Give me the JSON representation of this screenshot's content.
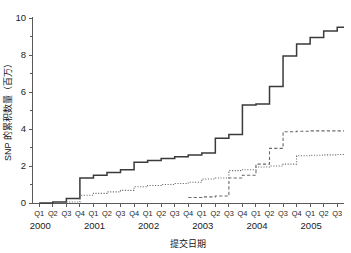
{
  "chart_data": {
    "type": "line",
    "title": "",
    "xlabel": "提交日期",
    "ylabel": "SNP 的累积数量（百万）",
    "ylim": [
      0,
      10
    ],
    "yticks": [
      0,
      2,
      4,
      6,
      8,
      10
    ],
    "ytick_labels": [
      "0",
      "2",
      "4",
      "6",
      "8",
      "10"
    ],
    "y_minor_ticks": [
      1,
      3,
      5,
      7,
      9
    ],
    "grid": false,
    "legend": "none",
    "step_style": "post",
    "x_quarter_labels": [
      "Q1",
      "Q2",
      "Q3",
      "Q4",
      "Q1",
      "Q2",
      "Q3",
      "Q4",
      "Q1",
      "Q2",
      "Q3",
      "Q4",
      "Q1",
      "Q2",
      "Q3",
      "Q4",
      "Q1",
      "Q2",
      "Q3",
      "Q4",
      "Q1",
      "Q2",
      "Q3"
    ],
    "x_year_labels": [
      "2000",
      "2001",
      "2002",
      "2003",
      "2004",
      "2005"
    ],
    "x_year_positions": [
      0,
      4,
      8,
      12,
      16,
      20
    ],
    "categories": [
      "2000 Q1",
      "2000 Q2",
      "2000 Q3",
      "2000 Q4",
      "2001 Q1",
      "2001 Q2",
      "2001 Q3",
      "2001 Q4",
      "2002 Q1",
      "2002 Q2",
      "2002 Q3",
      "2002 Q4",
      "2003 Q1",
      "2003 Q2",
      "2003 Q3",
      "2003 Q4",
      "2004 Q1",
      "2004 Q2",
      "2004 Q3",
      "2004 Q4",
      "2005 Q1",
      "2005 Q2",
      "2005 Q3"
    ],
    "series": [
      {
        "name": "solid-series",
        "style": "solid",
        "color": "#3a3a3a",
        "values": [
          0,
          0.05,
          0.25,
          1.35,
          1.5,
          1.65,
          1.8,
          2.2,
          2.3,
          2.4,
          2.5,
          2.6,
          2.7,
          3.5,
          3.7,
          5.3,
          5.35,
          6.3,
          7.95,
          8.6,
          8.95,
          9.3,
          9.5
        ]
      },
      {
        "name": "dashed-series",
        "style": "dashed",
        "color": "#6a6a6a",
        "values": [
          null,
          null,
          null,
          null,
          null,
          null,
          null,
          null,
          null,
          null,
          null,
          0.3,
          0.33,
          0.38,
          1.35,
          1.5,
          2.1,
          2.95,
          3.85,
          3.88,
          3.9,
          3.9,
          3.9
        ]
      },
      {
        "name": "dotted-series",
        "style": "dotted",
        "color": "#6a6a6a",
        "values": [
          null,
          null,
          0.05,
          0.42,
          0.52,
          0.6,
          0.68,
          0.88,
          0.95,
          1.0,
          1.05,
          1.12,
          1.3,
          1.35,
          1.75,
          1.8,
          1.95,
          2.0,
          2.1,
          2.55,
          2.58,
          2.6,
          2.62
        ]
      }
    ]
  },
  "axis_labels": {
    "y_title": "SNP 的累积数量（百万）",
    "x_title": "提交日期"
  }
}
